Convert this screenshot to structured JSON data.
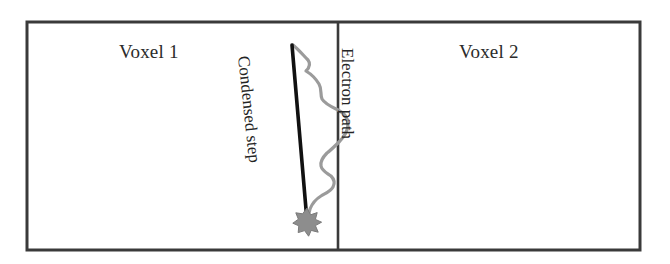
{
  "figure": {
    "background_color": "#ffffff",
    "border_color": "#3a3a3a",
    "condensed_step_color": "#111111",
    "electron_path_color": "#9b9b9b",
    "interaction_point_color": "#8f8f8f"
  },
  "labels": {
    "voxel_1": "Voxel 1",
    "voxel_2": "Voxel 2",
    "condensed_step": "Condensed step",
    "electron_path": "Electron path"
  },
  "geometry": {
    "outer_box": {
      "x": 27,
      "y": 22,
      "width": 613,
      "height": 228
    },
    "divider_x": 338,
    "start_point": {
      "x": 292,
      "y": 45
    },
    "end_point": {
      "x": 307,
      "y": 221
    }
  }
}
